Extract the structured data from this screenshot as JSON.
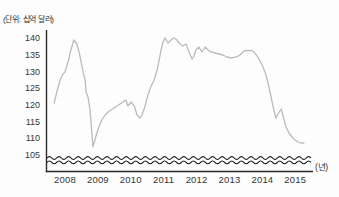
{
  "chart_data": {
    "type": "line",
    "title": "",
    "unit_label": "(단위: 십억 달러)",
    "x_unit_label": "(년)",
    "ylabel": "십억 달러",
    "xlabel": "년",
    "y_ticks": [
      105,
      110,
      115,
      120,
      125,
      130,
      135,
      140
    ],
    "x_ticks": [
      2008,
      2009,
      2010,
      2011,
      2012,
      2013,
      2014,
      2015
    ],
    "ylim": [
      105,
      141
    ],
    "xlim": [
      2007.55,
      2015.45
    ],
    "y_axis_break": true,
    "grid": false,
    "legend": false,
    "series": [
      {
        "points": [
          [
            2007.67,
            120.6
          ],
          [
            2007.76,
            124.2
          ],
          [
            2007.85,
            127.5
          ],
          [
            2007.94,
            129.3
          ],
          [
            2008.0,
            129.9
          ],
          [
            2008.09,
            132.9
          ],
          [
            2008.18,
            136.5
          ],
          [
            2008.27,
            139.5
          ],
          [
            2008.36,
            138.3
          ],
          [
            2008.43,
            135.9
          ],
          [
            2008.49,
            132.9
          ],
          [
            2008.55,
            129.9
          ],
          [
            2008.61,
            127.5
          ],
          [
            2008.64,
            123.9
          ],
          [
            2008.7,
            122.4
          ],
          [
            2008.76,
            118.5
          ],
          [
            2008.79,
            114.9
          ],
          [
            2008.82,
            111.0
          ],
          [
            2008.85,
            107.4
          ],
          [
            2008.91,
            109.5
          ],
          [
            2008.97,
            111.6
          ],
          [
            2009.03,
            113.4
          ],
          [
            2009.12,
            115.5
          ],
          [
            2009.22,
            117.0
          ],
          [
            2009.31,
            117.9
          ],
          [
            2009.4,
            118.5
          ],
          [
            2009.49,
            119.1
          ],
          [
            2009.58,
            119.7
          ],
          [
            2009.67,
            120.3
          ],
          [
            2009.76,
            120.9
          ],
          [
            2009.85,
            121.5
          ],
          [
            2009.91,
            119.7
          ],
          [
            2010.01,
            120.9
          ],
          [
            2010.1,
            119.8
          ],
          [
            2010.19,
            117.0
          ],
          [
            2010.28,
            116.1
          ],
          [
            2010.34,
            117.0
          ],
          [
            2010.43,
            119.5
          ],
          [
            2010.52,
            123.0
          ],
          [
            2010.61,
            125.5
          ],
          [
            2010.71,
            127.5
          ],
          [
            2010.8,
            130.5
          ],
          [
            2010.86,
            133.5
          ],
          [
            2010.92,
            136.5
          ],
          [
            2010.98,
            138.9
          ],
          [
            2011.04,
            140.1
          ],
          [
            2011.13,
            138.6
          ],
          [
            2011.22,
            139.5
          ],
          [
            2011.31,
            140.1
          ],
          [
            2011.4,
            139.5
          ],
          [
            2011.5,
            138.3
          ],
          [
            2011.59,
            137.7
          ],
          [
            2011.68,
            138.3
          ],
          [
            2011.77,
            135.9
          ],
          [
            2011.86,
            133.8
          ],
          [
            2011.92,
            134.7
          ],
          [
            2011.98,
            136.5
          ],
          [
            2012.07,
            137.4
          ],
          [
            2012.16,
            135.9
          ],
          [
            2012.26,
            137.4
          ],
          [
            2012.35,
            136.5
          ],
          [
            2012.44,
            135.9
          ],
          [
            2012.56,
            135.6
          ],
          [
            2012.68,
            135.3
          ],
          [
            2012.8,
            135.0
          ],
          [
            2012.92,
            134.4
          ],
          [
            2013.05,
            134.1
          ],
          [
            2013.14,
            134.3
          ],
          [
            2013.23,
            134.5
          ],
          [
            2013.32,
            135.0
          ],
          [
            2013.44,
            136.2
          ],
          [
            2013.56,
            136.4
          ],
          [
            2013.68,
            136.3
          ],
          [
            2013.78,
            135.5
          ],
          [
            2013.87,
            134.2
          ],
          [
            2013.96,
            132.6
          ],
          [
            2014.02,
            131.4
          ],
          [
            2014.11,
            129.0
          ],
          [
            2014.17,
            126.6
          ],
          [
            2014.23,
            123.9
          ],
          [
            2014.29,
            121.2
          ],
          [
            2014.35,
            118.5
          ],
          [
            2014.41,
            116.1
          ],
          [
            2014.47,
            117.3
          ],
          [
            2014.57,
            118.8
          ],
          [
            2014.66,
            115.5
          ],
          [
            2014.72,
            113.4
          ],
          [
            2014.81,
            111.6
          ],
          [
            2014.9,
            110.4
          ],
          [
            2014.99,
            109.5
          ],
          [
            2015.08,
            108.9
          ],
          [
            2015.17,
            108.6
          ],
          [
            2015.26,
            108.6
          ]
        ]
      }
    ]
  },
  "colors": {
    "background": "#fdfdfd",
    "series_line": "#b9bcbd",
    "axis": "#2b2b2b",
    "axis_break_wave": "#161616",
    "text": "#353535"
  }
}
